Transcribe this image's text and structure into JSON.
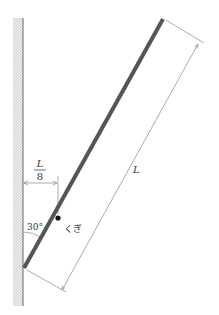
{
  "diagram": {
    "type": "physics-statics",
    "wall": {
      "label": ""
    },
    "rod": {
      "length_label": "L",
      "angle_label": "30°"
    },
    "nail": {
      "label": "くぎ"
    },
    "dimension_horizontal": {
      "numerator": "L",
      "denominator": "8"
    },
    "dimension_length": {
      "label": "L"
    },
    "colors": {
      "rod": "#555555",
      "wall_line": "#666666",
      "wall_hatch": "#d8d8d8",
      "dimension": "#888888",
      "nail": "#111111"
    }
  }
}
